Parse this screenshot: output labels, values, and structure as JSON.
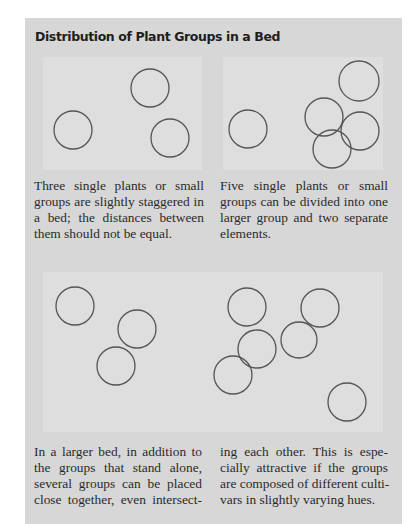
{
  "figure": {
    "title": "Distribution of Plant Groups in a Bed",
    "colors": {
      "outer_background": "#d7d7d7",
      "panel_background": "#dedede",
      "circle_stroke": "#555555",
      "text": "#2a2a2a"
    },
    "panels": [
      {
        "id": "three-plants",
        "circles": [
          {
            "cx": 150,
            "cy": 88,
            "r": 19
          },
          {
            "cx": 73,
            "cy": 130,
            "r": 19
          },
          {
            "cx": 170,
            "cy": 138,
            "r": 19
          }
        ],
        "caption_lines": [
          "Three single plants or small",
          "groups are slightly staggered in",
          "a bed; the distances between",
          "them should not be equal."
        ]
      },
      {
        "id": "five-plants",
        "circles": [
          {
            "cx": 359,
            "cy": 81,
            "r": 20
          },
          {
            "cx": 248,
            "cy": 129,
            "r": 19
          },
          {
            "cx": 324,
            "cy": 117,
            "r": 19
          },
          {
            "cx": 360,
            "cy": 131,
            "r": 19
          },
          {
            "cx": 332,
            "cy": 149,
            "r": 19
          }
        ],
        "caption_lines": [
          "Five single plants or small",
          "groups can be divided into one",
          "larger group and two separate",
          "elements."
        ]
      },
      {
        "id": "larger-bed",
        "circles": [
          {
            "cx": 75,
            "cy": 306,
            "r": 19
          },
          {
            "cx": 137,
            "cy": 329,
            "r": 19
          },
          {
            "cx": 116,
            "cy": 366,
            "r": 19
          },
          {
            "cx": 247,
            "cy": 307,
            "r": 19
          },
          {
            "cx": 320,
            "cy": 308,
            "r": 19
          },
          {
            "cx": 257,
            "cy": 349,
            "r": 19
          },
          {
            "cx": 299,
            "cy": 340,
            "r": 18
          },
          {
            "cx": 233,
            "cy": 375,
            "r": 19
          },
          {
            "cx": 347,
            "cy": 402,
            "r": 19
          }
        ],
        "caption_col1_lines": [
          "In a larger bed, in addition to",
          "the groups that stand alone,",
          "several groups can be placed",
          "close together, even intersect-"
        ],
        "caption_col2_lines": [
          "ing each other. This is espe-",
          "cially attractive if the groups",
          "are composed of different culti-",
          "vars in slightly varying hues."
        ]
      }
    ]
  }
}
